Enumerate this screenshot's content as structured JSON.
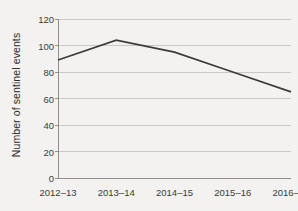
{
  "chart_data": {
    "type": "line",
    "title": "",
    "xlabel": "",
    "ylabel": "Number of sentinel events",
    "categories": [
      "2012–13",
      "2013–14",
      "2014–15",
      "2015–16",
      "2016–17"
    ],
    "values": [
      89,
      104,
      95,
      80,
      65
    ],
    "series": [
      {
        "name": "Number of sentinel events",
        "values": [
          89,
          104,
          95,
          80,
          65
        ]
      }
    ],
    "ylim": [
      0,
      120
    ],
    "yticks": [
      0,
      20,
      40,
      60,
      80,
      100,
      120
    ],
    "ytick_labels": [
      "0",
      "20",
      "40",
      "60",
      "80",
      "100",
      "120"
    ],
    "grid": "horizontal",
    "legend": "none",
    "markers": "none",
    "line_color": "#3b3b3b",
    "grid_color": "#c9c8c6",
    "axis_color": "#8f8e8c",
    "background_color": "#f3f2f0",
    "text_color": "#3a3a3a"
  }
}
